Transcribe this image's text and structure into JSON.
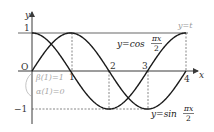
{
  "chart_data": {
    "type": "line",
    "title": "",
    "xlabel": "x",
    "ylabel": "y",
    "origin_label": "O",
    "xlim": [
      0,
      4.25
    ],
    "ylim": [
      -1,
      1
    ],
    "x_ticks": [
      "1",
      "2",
      "3",
      "4"
    ],
    "x_tick_values": [
      1,
      2,
      3,
      4
    ],
    "y_ticks": [
      "1",
      "−1"
    ],
    "y_tick_values": [
      1,
      -1
    ],
    "series": [
      {
        "name": "y=cos(πx/2)",
        "label_prefix": "y=cos",
        "label_num": "πx",
        "label_den": "2",
        "x": [
          0,
          0.5,
          1,
          1.5,
          2,
          2.5,
          3,
          3.5,
          4
        ],
        "values": [
          1,
          0.707,
          0,
          -0.707,
          -1,
          -0.707,
          0,
          0.707,
          1
        ]
      },
      {
        "name": "y=sin(πx/2)",
        "label_prefix": "y=sin",
        "label_num": "πx",
        "label_den": "2",
        "x": [
          0,
          0.5,
          1,
          1.5,
          2,
          2.5,
          3,
          3.5,
          4
        ],
        "values": [
          0,
          0.707,
          1,
          0.707,
          0,
          -0.707,
          -1,
          -0.707,
          0
        ]
      },
      {
        "name": "y=t",
        "label": "y=t",
        "x": [
          0,
          4
        ],
        "values": [
          1,
          1
        ]
      }
    ],
    "annotations": [
      {
        "text": "β(1)=1"
      },
      {
        "text": "α(1)=0"
      }
    ],
    "grid": false,
    "legend": "none"
  },
  "colors": {
    "curve": "#1a1a1a",
    "axis": "#3a3a3a",
    "t_line": "#9a9a9a",
    "annotation": "#a8a8a8",
    "dashed": "#555555"
  }
}
